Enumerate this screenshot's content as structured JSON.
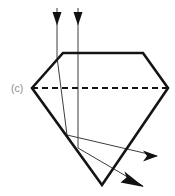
{
  "figure": {
    "panel_label": "(c)",
    "caption_text": "",
    "background_color": "#ffffff",
    "width_px": 175,
    "height_px": 196
  },
  "colors": {
    "gem_outline": "#141414",
    "girdle_dashed": "#141414",
    "ray_stroke": "#3d3d3d",
    "arrow_fill": "#111111",
    "label_gray": "#8d8d8d"
  },
  "gem": {
    "name": "round-brilliant-cut-diamond-cross-section",
    "table_label": "table",
    "crown_label": "crown",
    "girdle_label": "girdle",
    "pavilion_label": "pavilion",
    "culet_label": "culet",
    "outline_points": "63,53 143,53 168,88 102,185 32,88",
    "girdle_line": {
      "x1": 32,
      "y1": 88,
      "x2": 168,
      "y2": 88,
      "dash": "6,4"
    },
    "stroke_width": 2.6
  },
  "rays": {
    "incident": [
      {
        "name": "incident-ray-left",
        "label": "incident ray 1",
        "path": "M 57,8 L 57,57",
        "arrow_at": {
          "x": 57,
          "y": 24,
          "direction": "down"
        }
      },
      {
        "name": "incident-ray-right",
        "label": "incident ray 2",
        "path": "M 78,8 L 78,53",
        "arrow_at": {
          "x": 78,
          "y": 24,
          "direction": "down"
        }
      }
    ],
    "internal": [
      {
        "name": "internal-ray-left",
        "label": "refracted and reflected ray 1",
        "path": "M 57,57 L 67,135 L 157,156"
      },
      {
        "name": "internal-ray-right",
        "label": "refracted and reflected ray 2",
        "path": "M 78,53 L 78,148 L 143,186"
      }
    ],
    "exit": [
      {
        "name": "exit-ray-horizontal",
        "label": "exit ray right",
        "arrow_tip": {
          "x": 157,
          "y": 156
        },
        "direction": "right"
      },
      {
        "name": "exit-ray-diagonal",
        "label": "exit ray lower right",
        "arrow_tip": {
          "x": 143,
          "y": 186
        },
        "direction": "down-right"
      }
    ],
    "stroke_width": 1.0
  }
}
